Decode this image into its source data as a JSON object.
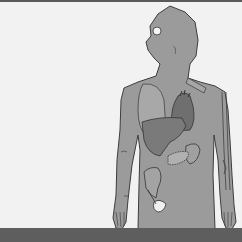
{
  "figure": {
    "organs": [
      "head",
      "lungs",
      "heart",
      "liver",
      "stomach",
      "pancreas",
      "large-intestine",
      "bladder",
      "arm-veins",
      "hands"
    ],
    "labels": []
  },
  "colors": {
    "background": "#f2f2f2",
    "body": "#9b9b9b",
    "body_outline": "#3d3d3d",
    "lung": "#a8a8a8",
    "heart": "#6f6f6f",
    "liver": "#7a7a7a",
    "organ_light": "#b0b0b0",
    "eye": "#f5f5f5",
    "bars": "#5e5e5e"
  }
}
